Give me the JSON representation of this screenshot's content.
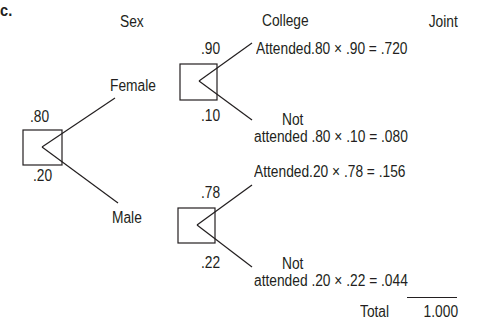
{
  "part_label": "c.",
  "headers": {
    "sex": "Sex",
    "college": "College",
    "joint": "Joint"
  },
  "root": {
    "prob_female": ".80",
    "prob_male": ".20"
  },
  "branches": {
    "female": {
      "label": "Female",
      "prob_attended": ".90",
      "prob_not_attended": ".10"
    },
    "male": {
      "label": "Male",
      "prob_attended": ".78",
      "prob_not_attended": ".22"
    }
  },
  "outcomes": [
    {
      "not_label": "",
      "label": "Attended",
      "expr": ".80 × .90 = .720"
    },
    {
      "not_label": "Not",
      "label": "attended",
      "expr": ".80 × .10 = .080"
    },
    {
      "not_label": "",
      "label": "Attended",
      "expr": ".20 × .78  = .156"
    },
    {
      "not_label": "Not",
      "label": "attended",
      "expr": ".20 × .22 = .044"
    }
  ],
  "total": {
    "label": "Total",
    "value": "1.000"
  },
  "colors": {
    "ink": "#231f20",
    "background": "#ffffff"
  }
}
